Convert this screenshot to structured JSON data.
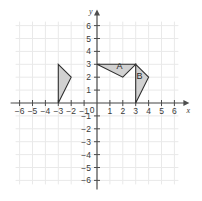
{
  "chart_data": {
    "type": "scatter",
    "title": "",
    "xlabel": "x",
    "ylabel": "y",
    "xlim": [
      -6,
      6
    ],
    "ylim": [
      -6,
      6
    ],
    "grid": true,
    "legend": "none",
    "x_ticks": [
      -6,
      -5,
      -4,
      -3,
      -2,
      -1,
      0,
      1,
      2,
      3,
      4,
      5,
      6
    ],
    "y_ticks": [
      -6,
      -5,
      -4,
      -3,
      -2,
      -1,
      1,
      2,
      3,
      4,
      5,
      6
    ],
    "x_tick_labels": [
      "-6",
      "-5",
      "-4",
      "-3",
      "-2",
      "-1",
      "0",
      "1",
      "2",
      "3",
      "4",
      "5",
      "6"
    ],
    "y_tick_labels": [
      "-6",
      "-5",
      "-4",
      "-3",
      "-2",
      "-1",
      "1",
      "2",
      "3",
      "4",
      "5",
      "6"
    ],
    "origin_label": "0",
    "shapes": [
      {
        "name": "left-triangle",
        "label": "",
        "vertices": [
          [
            -3,
            3
          ],
          [
            -2,
            2
          ],
          [
            -3,
            0
          ]
        ],
        "fill": "#cfcfcf",
        "stroke": "#2e2e2e"
      },
      {
        "name": "triangle-a",
        "label": "A",
        "label_position": [
          1.75,
          2.62
        ],
        "vertices": [
          [
            0,
            3
          ],
          [
            3,
            3
          ],
          [
            2,
            2
          ]
        ],
        "fill": "#cfcfcf",
        "stroke": "#2e2e2e"
      },
      {
        "name": "triangle-b",
        "label": "B",
        "label_position": [
          3.3,
          1.85
        ],
        "vertices": [
          [
            3,
            3
          ],
          [
            4,
            2
          ],
          [
            3,
            0
          ]
        ],
        "fill": "#cfcfcf",
        "stroke": "#2e2e2e"
      }
    ]
  },
  "axes": {
    "x_axis_label": "x",
    "y_axis_label": "y"
  },
  "colors": {
    "background": "#ffffff",
    "grid": "#e9e9e9",
    "axis": "#4d4d4d",
    "shape_fill": "#cfcfcf",
    "shape_stroke": "#2e2e2e",
    "text": "#3a3a3a"
  }
}
